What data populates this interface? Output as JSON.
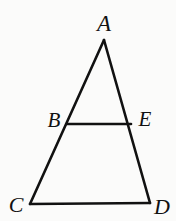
{
  "figure": {
    "kind": "geometry-diagram",
    "background_color": "#fbfbfa",
    "stroke_color": "#111111",
    "stroke_width": 2.6,
    "width": 176,
    "height": 221,
    "points": {
      "A": {
        "label": "A",
        "x": 104,
        "y": 40,
        "label_x": 104,
        "label_y": 23
      },
      "B": {
        "label": "B",
        "x": 67,
        "y": 124,
        "label_x": 54,
        "label_y": 120
      },
      "E": {
        "label": "E",
        "x": 131,
        "y": 124,
        "label_x": 145,
        "label_y": 119
      },
      "C": {
        "label": "C",
        "x": 30,
        "y": 204,
        "label_x": 16,
        "label_y": 205
      },
      "D": {
        "label": "D",
        "x": 150,
        "y": 203,
        "label_x": 162,
        "label_y": 207
      }
    },
    "segments": [
      {
        "name": "side-AC",
        "from": "A",
        "to": "C",
        "path": "M 104 40 L 30 204"
      },
      {
        "name": "side-AD",
        "from": "A",
        "to": "D",
        "path": "M 104 40 L 150 203"
      },
      {
        "name": "base-CD",
        "from": "C",
        "to": "D",
        "path": "M 30 204 L 150 203"
      },
      {
        "name": "segment-BE",
        "from": "B",
        "to": "E",
        "path": "M 67 124 L 131 124"
      }
    ]
  }
}
